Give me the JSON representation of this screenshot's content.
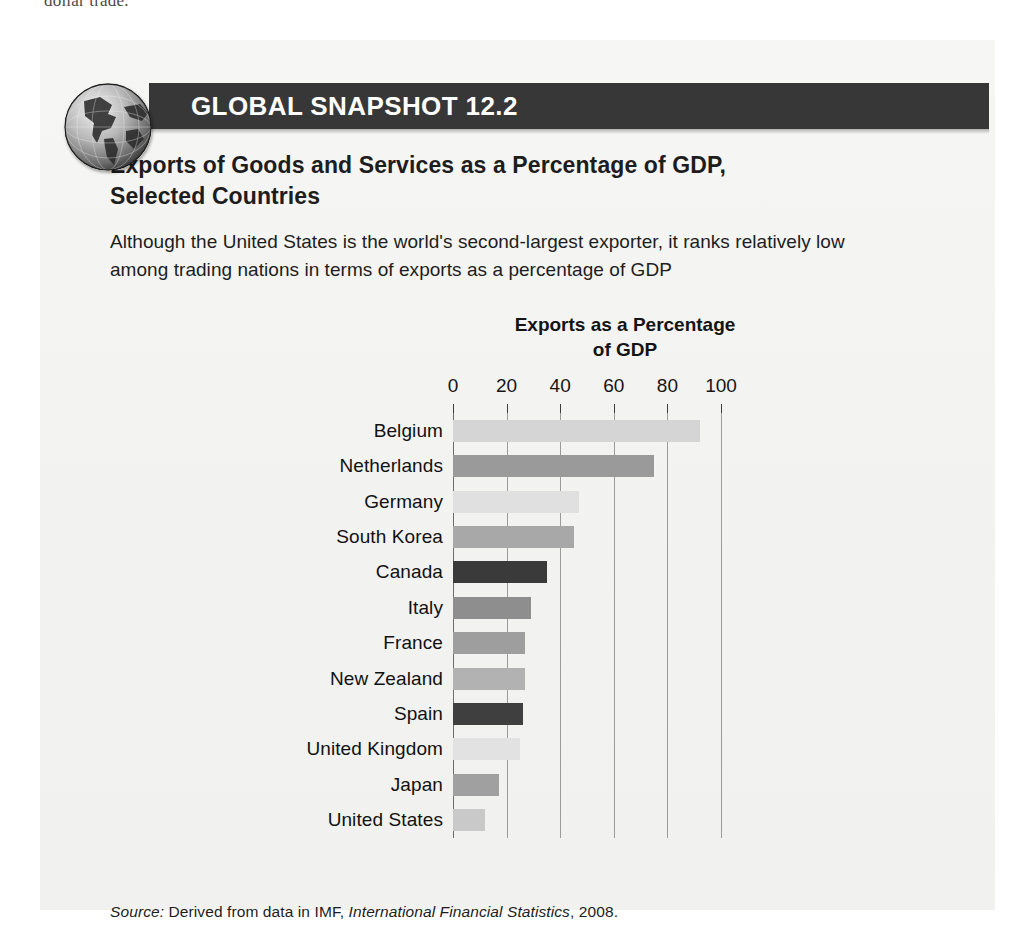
{
  "page": {
    "cut_off_running_text": "dollar trade."
  },
  "header": {
    "badge_icon": "globe-icon",
    "title": "GLOBAL SNAPSHOT 12.2",
    "bar_color": "#373737"
  },
  "content": {
    "heading": "Exports of Goods and Services as a Percentage of GDP, Selected Countries",
    "subtext": "Although the United States is the world's second-largest exporter, it ranks relatively low among trading nations in terms of exports as a percentage of GDP"
  },
  "source": {
    "prefix": "Source:",
    "text_before_italic": " Derived from data in IMF, ",
    "italic_title": "International Financial Statistics",
    "text_after_italic": ", 2008."
  },
  "chart_data": {
    "type": "bar",
    "orientation": "horizontal",
    "title": "Exports as a Percentage of GDP",
    "title_line1": "Exports as a Percentage",
    "title_line2": "of GDP",
    "xlabel": "",
    "ylabel": "",
    "xlim": [
      0,
      100
    ],
    "xticks": [
      0,
      20,
      40,
      60,
      80,
      100
    ],
    "xtick_labels": [
      "0",
      "20",
      "40",
      "60",
      "80",
      "100"
    ],
    "grid": true,
    "legend": "none",
    "categories": [
      "Belgium",
      "Netherlands",
      "Germany",
      "South Korea",
      "Canada",
      "Italy",
      "France",
      "New Zealand",
      "Spain",
      "United Kingdom",
      "Japan",
      "United States"
    ],
    "values": [
      92,
      75,
      47,
      45,
      35,
      29,
      27,
      27,
      26,
      25,
      17,
      12
    ],
    "bar_colors": [
      "#d5d5d5",
      "#9a9a9a",
      "#e0e0e0",
      "#a8a8a8",
      "#3a3a3a",
      "#8e8e8e",
      "#9e9e9e",
      "#b2b2b2",
      "#3f3f3f",
      "#e2e2e2",
      "#a0a0a0",
      "#c9c9c9"
    ]
  }
}
